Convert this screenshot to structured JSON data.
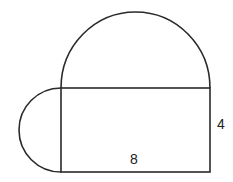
{
  "diagram": {
    "shapes": [
      {
        "type": "rectangle",
        "width_label": "8",
        "height_label": "4"
      },
      {
        "type": "semicircle",
        "position": "top",
        "diameter": "8"
      },
      {
        "type": "semicircle",
        "position": "left",
        "diameter": "4"
      }
    ],
    "labels": {
      "width": "8",
      "height": "4"
    },
    "stroke_color": "#2a2a2a"
  }
}
